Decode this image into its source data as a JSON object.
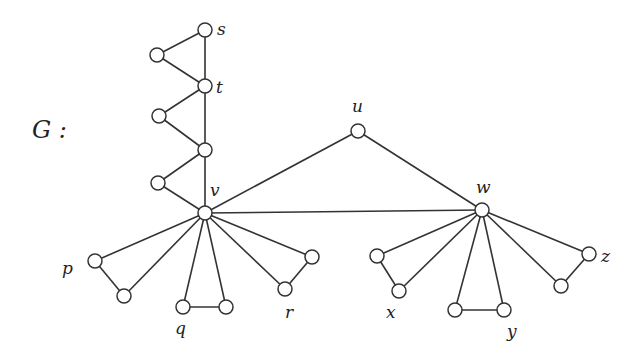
{
  "graph": {
    "name": "G :",
    "name_position": [
      32,
      138
    ],
    "colors": {
      "edge": "#333333",
      "node_fill": "#ffffff",
      "node_stroke": "#333333",
      "text": "#222222"
    },
    "node_radius": 7,
    "nodes": [
      {
        "id": "s",
        "x": 205,
        "y": 30,
        "label": "s",
        "lx": 217,
        "ly": 35
      },
      {
        "id": "a1",
        "x": 157,
        "y": 55,
        "label": ""
      },
      {
        "id": "t",
        "x": 205,
        "y": 86,
        "label": "t",
        "lx": 216,
        "ly": 93
      },
      {
        "id": "a2",
        "x": 159,
        "y": 116,
        "label": ""
      },
      {
        "id": "m",
        "x": 205,
        "y": 150,
        "label": ""
      },
      {
        "id": "a3",
        "x": 158,
        "y": 183,
        "label": ""
      },
      {
        "id": "v",
        "x": 205,
        "y": 213,
        "label": "v",
        "lx": 210,
        "ly": 196
      },
      {
        "id": "u",
        "x": 358,
        "y": 131,
        "label": "u",
        "lx": 352,
        "ly": 112
      },
      {
        "id": "w",
        "x": 482,
        "y": 210,
        "label": "w",
        "lx": 476,
        "ly": 193
      },
      {
        "id": "p1",
        "x": 95,
        "y": 261,
        "label": "p",
        "lx": 62,
        "ly": 274
      },
      {
        "id": "p2",
        "x": 124,
        "y": 296,
        "label": ""
      },
      {
        "id": "q1",
        "x": 183,
        "y": 307,
        "label": "q",
        "lx": 175,
        "ly": 334
      },
      {
        "id": "q2",
        "x": 226,
        "y": 307,
        "label": ""
      },
      {
        "id": "r1",
        "x": 312,
        "y": 257,
        "label": ""
      },
      {
        "id": "r2",
        "x": 285,
        "y": 289,
        "label": "r",
        "lx": 285,
        "ly": 318
      },
      {
        "id": "x1",
        "x": 377,
        "y": 256,
        "label": ""
      },
      {
        "id": "x2",
        "x": 399,
        "y": 291,
        "label": "x",
        "lx": 386,
        "ly": 318
      },
      {
        "id": "y1",
        "x": 455,
        "y": 310,
        "label": ""
      },
      {
        "id": "y2",
        "x": 504,
        "y": 310,
        "label": "y",
        "lx": 507,
        "ly": 337
      },
      {
        "id": "z1",
        "x": 589,
        "y": 254,
        "label": "z",
        "lx": 601,
        "ly": 262
      },
      {
        "id": "z2",
        "x": 561,
        "y": 286,
        "label": ""
      }
    ],
    "edges": [
      [
        "s",
        "a1"
      ],
      [
        "a1",
        "t"
      ],
      [
        "s",
        "t"
      ],
      [
        "t",
        "a2"
      ],
      [
        "a2",
        "m"
      ],
      [
        "t",
        "m"
      ],
      [
        "m",
        "a3"
      ],
      [
        "a3",
        "v"
      ],
      [
        "m",
        "v"
      ],
      [
        "v",
        "u"
      ],
      [
        "u",
        "w"
      ],
      [
        "v",
        "w"
      ],
      [
        "v",
        "p1"
      ],
      [
        "v",
        "p2"
      ],
      [
        "p1",
        "p2"
      ],
      [
        "v",
        "q1"
      ],
      [
        "v",
        "q2"
      ],
      [
        "q1",
        "q2"
      ],
      [
        "v",
        "r1"
      ],
      [
        "v",
        "r2"
      ],
      [
        "r1",
        "r2"
      ],
      [
        "w",
        "x1"
      ],
      [
        "w",
        "x2"
      ],
      [
        "x1",
        "x2"
      ],
      [
        "w",
        "y1"
      ],
      [
        "w",
        "y2"
      ],
      [
        "y1",
        "y2"
      ],
      [
        "w",
        "z1"
      ],
      [
        "w",
        "z2"
      ],
      [
        "z1",
        "z2"
      ]
    ]
  }
}
